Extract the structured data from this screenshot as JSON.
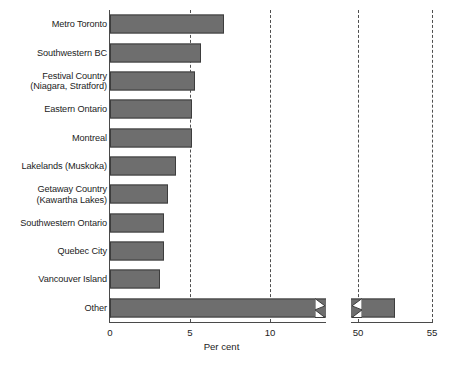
{
  "chart_data": {
    "type": "bar",
    "orientation": "horizontal",
    "title": "",
    "subtitle": "",
    "xlabel": "Per cent",
    "ylabel": "",
    "categories": [
      "Metro Toronto",
      "Southwestern BC",
      "Festival Country\n(Niagara, Stratford)",
      "Eastern Ontario",
      "Montreal",
      "Lakelands (Muskoka)",
      "Getaway Country\n(Kawartha Lakes)",
      "Southwestern Ontario",
      "Quebec City",
      "Vancouver Island",
      "Other"
    ],
    "values": [
      7.1,
      5.7,
      5.3,
      5.1,
      5.1,
      4.1,
      3.6,
      3.4,
      3.4,
      3.1,
      52.5
    ],
    "xlim": [
      0,
      55
    ],
    "axis_break": {
      "present": true,
      "from": 13.5,
      "to": 48.5,
      "style": "zigzag"
    },
    "xticks": [
      0,
      5,
      10,
      50,
      55
    ],
    "xtick_labels": [
      "0",
      "5",
      "10",
      "50",
      "55"
    ],
    "gridlines_at": [
      5,
      10,
      50,
      55
    ],
    "grid": true,
    "grid_style": "dashed",
    "legend": null,
    "colors": {
      "bar_fill": "#6e6e6e",
      "bar_stroke": "#3d3d3d",
      "axis": "#4a4a4a",
      "grid": "#4f4f4f",
      "text": "#1c1c1c",
      "background": "#ffffff"
    }
  }
}
